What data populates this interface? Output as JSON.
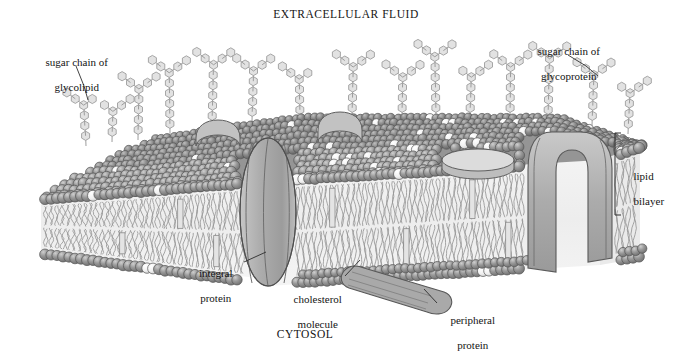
{
  "diagram": {
    "type": "cell-membrane-cross-section",
    "regions": {
      "top_label": "EXTRACELLULAR FLUID",
      "bottom_label": "CYTOSOL"
    },
    "labels": [
      {
        "id": "sugar-chain-glycolipid",
        "line1": "sugar chain of",
        "line2": "glycolipid",
        "align": "center"
      },
      {
        "id": "sugar-chain-glycoprotein",
        "line1": "sugar chain of",
        "line2": "glycoprotein",
        "align": "center"
      },
      {
        "id": "lipid-bilayer",
        "line1": "lipid",
        "line2": "bilayer",
        "align": "left"
      },
      {
        "id": "integral-protein",
        "line1": "integral",
        "line2": "protein",
        "align": "center"
      },
      {
        "id": "cholesterol-molecule",
        "line1": "cholesterol",
        "line2": "molecule",
        "align": "center"
      },
      {
        "id": "peripheral-protein",
        "line1": "peripheral",
        "line2": "protein",
        "align": "center"
      }
    ],
    "colors": {
      "background": "#ffffff",
      "ink": "#1a1a1a",
      "head_front": "#8e8e8e",
      "head_top": "#7b7b7b",
      "head_dark": "#6f6f6f",
      "head_highlight": "#f2f2f2",
      "cholesterol": "#f4f4f4",
      "protein_fill": "#b4b4b4",
      "protein_fill_light": "#c9c9c9",
      "sugar_fill": "#e2e2e2",
      "tail_line": "#909090",
      "interior": "#f1f1f1",
      "outline": "#4a4a4a"
    },
    "components": {
      "phospholipid_heads": "spheres",
      "phospholipid_tails": "wavy lines",
      "integral_proteins": 2,
      "peripheral_proteins": 2,
      "sugar_chain_units": "hexagons"
    }
  }
}
